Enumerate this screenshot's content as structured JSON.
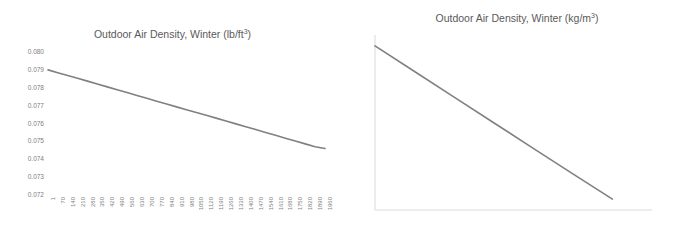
{
  "figure": {
    "background_color": "#ffffff",
    "series_color": "#808080",
    "axis_color": "#d9d9d9",
    "text_color": "#808080",
    "title_color": "#5a5a5a"
  },
  "charts": [
    {
      "id": "imperial",
      "title_main": "Outdoor Air Density, Winter (lb/ft",
      "title_sup": "3",
      "title_tail": ")",
      "title_full": "Outdoor Air Density, Winter (lb/ft3)"
    },
    {
      "id": "metric",
      "title_main": "Outdoor Air Density, Winter (kg/m",
      "title_sup": "3",
      "title_tail": ")",
      "title_full": "Outdoor Air Density, Winter (kg/m3)"
    }
  ],
  "chart_data": [
    {
      "type": "line",
      "id": "imperial",
      "title": "Outdoor Air Density, Winter (lb/ft3)",
      "xlabel": "",
      "ylabel": "",
      "grid": false,
      "legend": "none",
      "axis_lines": false,
      "xlim": [
        1,
        1960
      ],
      "ylim": [
        0.072,
        0.08
      ],
      "ytick_labels": [
        "0.080",
        "0.079",
        "0.078",
        "0.077",
        "0.076",
        "0.075",
        "0.074",
        "0.073",
        "0.072"
      ],
      "ytick_values": [
        0.08,
        0.079,
        0.078,
        0.077,
        0.076,
        0.075,
        0.074,
        0.073,
        0.072
      ],
      "xtick_labels": [
        "1",
        "70",
        "140",
        "210",
        "280",
        "350",
        "420",
        "490",
        "560",
        "630",
        "700",
        "770",
        "840",
        "910",
        "980",
        "1050",
        "1120",
        "1190",
        "1260",
        "1330",
        "1400",
        "1470",
        "1540",
        "1610",
        "1680",
        "1750",
        "1820",
        "1890",
        "1960"
      ],
      "xtick_values": [
        1,
        70,
        140,
        210,
        280,
        350,
        420,
        490,
        560,
        630,
        700,
        770,
        840,
        910,
        980,
        1050,
        1120,
        1190,
        1260,
        1330,
        1400,
        1470,
        1540,
        1610,
        1680,
        1750,
        1820,
        1890,
        1960
      ],
      "x": [
        1,
        70,
        140,
        210,
        280,
        350,
        420,
        490,
        560,
        630,
        700,
        770,
        840,
        910,
        980,
        1050,
        1120,
        1190,
        1260,
        1330,
        1400,
        1470,
        1540,
        1610,
        1680,
        1750,
        1820,
        1890,
        1960
      ],
      "values": [
        0.079,
        0.07884,
        0.07869,
        0.07853,
        0.07837,
        0.07821,
        0.07805,
        0.07789,
        0.07773,
        0.07757,
        0.07741,
        0.07725,
        0.07709,
        0.07693,
        0.07677,
        0.07661,
        0.07646,
        0.0763,
        0.07614,
        0.07598,
        0.07582,
        0.07566,
        0.0755,
        0.07534,
        0.07518,
        0.07502,
        0.07486,
        0.0747,
        0.0746
      ]
    },
    {
      "type": "line",
      "id": "metric",
      "title": "Outdoor Air Density, Winter (kg/m3)",
      "xlabel": "",
      "ylabel": "",
      "grid": false,
      "legend": "none",
      "axis_lines": true,
      "xlim": [
        0,
        700
      ],
      "ylim": [
        1.19,
        1.27
      ],
      "ytick_labels": [
        "1.27",
        "1.26",
        "1.25",
        "1.24",
        "1.23",
        "1.22",
        "1.21",
        "1.20",
        "1.19"
      ],
      "ytick_values": [
        1.27,
        1.26,
        1.25,
        1.24,
        1.23,
        1.22,
        1.21,
        1.2,
        1.19
      ],
      "xtick_labels": [
        "0",
        "100",
        "200",
        "300",
        "400",
        "500",
        "600",
        "700"
      ],
      "xtick_values": [
        0,
        100,
        200,
        300,
        400,
        500,
        600,
        700
      ],
      "x": [
        0,
        100,
        200,
        300,
        400,
        500,
        600
      ],
      "values": [
        1.265,
        1.2533,
        1.2416,
        1.2299,
        1.2182,
        1.2065,
        1.195
      ]
    }
  ]
}
